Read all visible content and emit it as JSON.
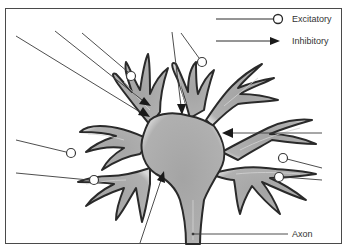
{
  "diagram": {
    "legend": {
      "excitatory": {
        "label": "Excitatory",
        "symbol": "open-circle-terminal"
      },
      "inhibitory": {
        "label": "Inhibitory",
        "symbol": "filled-arrowhead-terminal"
      }
    },
    "labels": {
      "axon": "Axon"
    },
    "colors": {
      "cell_fill": "#a8a8a8",
      "cell_outline": "#2a2a2a",
      "line": "#3a3a3a",
      "background": "#ffffff"
    },
    "synapses": {
      "excitatory_count": 6,
      "inhibitory_count": 5
    }
  }
}
